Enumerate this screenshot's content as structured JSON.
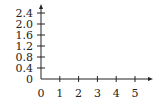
{
  "chart_data": {
    "type": "line",
    "title": "",
    "xlabel": "",
    "ylabel": "",
    "xlim": [
      0,
      5
    ],
    "ylim": [
      0,
      2.4
    ],
    "x_ticks": [
      0,
      1,
      2,
      3,
      4,
      5
    ],
    "x_tick_labels": [
      "0",
      "1",
      "2",
      "3",
      "4",
      "5"
    ],
    "y_ticks": [
      0,
      0.4,
      0.8,
      1.2,
      1.6,
      2.0,
      2.4
    ],
    "y_tick_labels": [
      "0",
      "0.4",
      "0.8",
      "1.2",
      "1.6",
      "2.0",
      "2.4"
    ],
    "series": [],
    "grid": false,
    "legend": "none",
    "colors": {
      "axis": "#222222"
    }
  }
}
